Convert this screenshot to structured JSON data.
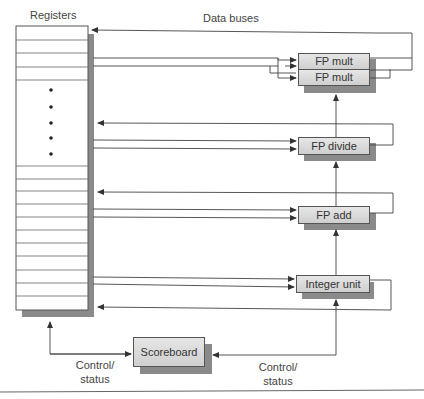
{
  "labels": {
    "registers": "Registers",
    "data_buses": "Data buses",
    "control_status_left": [
      "Control/",
      "status"
    ],
    "control_status_right": [
      "Control/",
      "status"
    ]
  },
  "units": {
    "fp_mult_1": "FP mult",
    "fp_mult_2": "FP mult",
    "fp_divide": "FP divide",
    "fp_add": "FP add",
    "integer_unit": "Integer unit",
    "scoreboard": "Scoreboard"
  },
  "register_file": {
    "ellipsis_dots": 5
  },
  "colors": {
    "box_fill_top": "#e6e6e6",
    "box_fill_bottom": "#cfcfcf",
    "shadow": "#8a8a8a",
    "line": "#444444"
  }
}
